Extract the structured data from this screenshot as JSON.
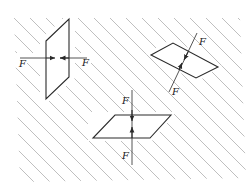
{
  "diagram": {
    "colors": {
      "hatch": "#b5b5b5",
      "stroke": "#2a2a2a",
      "background": "#ffffff"
    },
    "elements": [
      {
        "id": "vertical-element",
        "force_labels": [
          "F",
          "F"
        ]
      },
      {
        "id": "inclined-element",
        "force_labels": [
          "F",
          "F"
        ]
      },
      {
        "id": "horizontal-element",
        "force_labels": [
          "F",
          "F"
        ]
      }
    ]
  },
  "labels": {
    "left_f1": "F",
    "left_f2": "F",
    "right_f1": "F",
    "right_f2": "F",
    "bottom_f1": "F",
    "bottom_f2": "F"
  }
}
